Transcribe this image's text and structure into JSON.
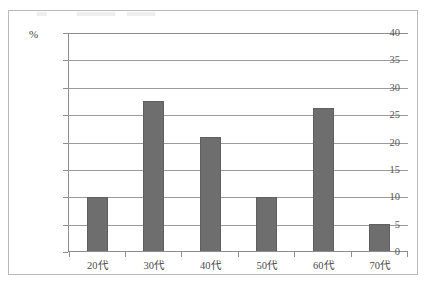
{
  "figure": {
    "percent_symbol": "%"
  },
  "chart_data": {
    "type": "bar",
    "title": "",
    "xlabel": "",
    "ylabel": "%",
    "categories": [
      "20代",
      "30代",
      "40代",
      "50代",
      "60代",
      "70代"
    ],
    "values": [
      10,
      27.5,
      21,
      10,
      26.3,
      5
    ],
    "ylim": [
      0,
      40
    ],
    "ytick_step": 5,
    "ytick_labels": [
      "40",
      "35",
      "30",
      "25",
      "20",
      "15",
      "10",
      "5",
      "0"
    ],
    "grid": true,
    "legend": "none",
    "bar_color": "#6e6e6e",
    "gridline_color": "#9a9a9a",
    "axis_color": "#8d8d8d",
    "frame_color": "#b9b9b9"
  }
}
